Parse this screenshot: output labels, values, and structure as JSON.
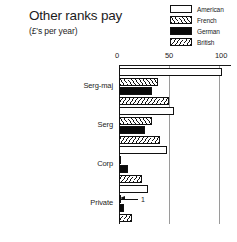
{
  "chart_data": {
    "type": "bar",
    "orientation": "horizontal",
    "title": "Other ranks pay",
    "subtitle": "(£'s per year)",
    "xlabel": "",
    "ylabel": "",
    "xlim": [
      0,
      110
    ],
    "ticks": [
      "0",
      "50",
      "100"
    ],
    "tick_values": [
      0,
      50,
      100
    ],
    "grid": true,
    "legend_position": "top-right",
    "categories": [
      "Serg-maj",
      "Serg",
      "Corp",
      "Private"
    ],
    "series": [
      {
        "name": "American",
        "fill": "fill-american",
        "values": [
          103,
          55,
          48,
          29
        ]
      },
      {
        "name": "French",
        "fill": "fill-french",
        "values": [
          39,
          33,
          2,
          1
        ]
      },
      {
        "name": "German",
        "fill": "fill-german",
        "values": [
          33,
          26,
          9,
          5
        ]
      },
      {
        "name": "British",
        "fill": "fill-british",
        "values": [
          50,
          41,
          23,
          13
        ]
      }
    ],
    "annotations": [
      {
        "category": "Private",
        "series": "French",
        "value": "1"
      }
    ]
  },
  "legend": {
    "items": [
      {
        "label": "American",
        "swatch": "fill-american"
      },
      {
        "label": "French",
        "swatch": "fill-french"
      },
      {
        "label": "German",
        "swatch": "fill-german"
      },
      {
        "label": "British",
        "swatch": "fill-british"
      }
    ]
  },
  "colors": {
    "ink": "#111111",
    "gridline": "#9a9a9a",
    "background": "#ffffff"
  }
}
